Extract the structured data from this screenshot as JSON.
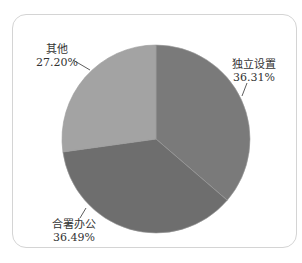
{
  "chart_data": {
    "type": "pie",
    "title": "",
    "slices": [
      {
        "label": "独立设置",
        "value": 36.31,
        "display": "36.31%",
        "color": "#7a7a7a"
      },
      {
        "label": "合署办公",
        "value": 36.49,
        "display": "36.49%",
        "color": "#6e6e6e"
      },
      {
        "label": "其他",
        "value": 27.2,
        "display": "27.20%",
        "color": "#a3a3a3"
      }
    ],
    "start_angle_deg": 0,
    "direction": "clockwise",
    "legend": "none",
    "data_labels": "outside with leader lines"
  },
  "labels": {
    "s0": {
      "name": "独立设置",
      "pct": "36.31%"
    },
    "s1": {
      "name": "合署办公",
      "pct": "36.49%"
    },
    "s2": {
      "name": "其他",
      "pct": "27.20%"
    }
  }
}
